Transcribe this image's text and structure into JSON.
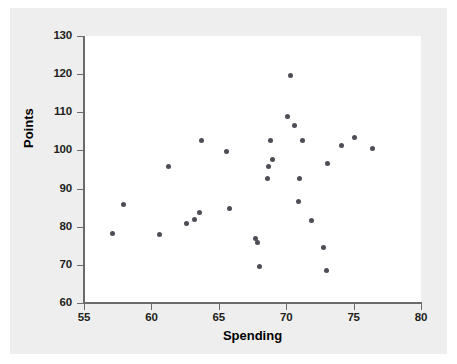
{
  "chart_data": {
    "type": "scatter",
    "title": "",
    "xlabel": "Spending",
    "ylabel": "Points",
    "xlim": [
      55,
      80
    ],
    "ylim": [
      60,
      130
    ],
    "xticks": [
      55,
      60,
      65,
      70,
      75,
      80
    ],
    "yticks": [
      60,
      70,
      80,
      90,
      100,
      110,
      120,
      130
    ],
    "grid": false,
    "legend": null,
    "marker_color": "#4d4d56",
    "plot_background": "#ffffff",
    "figure_background": "#eeeeee",
    "points": [
      {
        "x": 57.1,
        "y": 78.2
      },
      {
        "x": 57.9,
        "y": 85.9
      },
      {
        "x": 60.6,
        "y": 78.0
      },
      {
        "x": 61.3,
        "y": 95.9
      },
      {
        "x": 62.6,
        "y": 80.9
      },
      {
        "x": 63.2,
        "y": 81.8
      },
      {
        "x": 63.6,
        "y": 83.8
      },
      {
        "x": 63.7,
        "y": 102.6
      },
      {
        "x": 65.6,
        "y": 99.8
      },
      {
        "x": 65.8,
        "y": 84.7
      },
      {
        "x": 67.7,
        "y": 77.0
      },
      {
        "x": 67.9,
        "y": 75.8
      },
      {
        "x": 68.0,
        "y": 69.7
      },
      {
        "x": 68.6,
        "y": 92.6
      },
      {
        "x": 68.7,
        "y": 95.7
      },
      {
        "x": 68.8,
        "y": 102.5
      },
      {
        "x": 69.0,
        "y": 97.6
      },
      {
        "x": 70.1,
        "y": 108.8
      },
      {
        "x": 70.3,
        "y": 119.7
      },
      {
        "x": 70.6,
        "y": 106.5
      },
      {
        "x": 70.9,
        "y": 86.6
      },
      {
        "x": 71.0,
        "y": 92.6
      },
      {
        "x": 71.2,
        "y": 102.5
      },
      {
        "x": 71.9,
        "y": 81.5
      },
      {
        "x": 72.8,
        "y": 74.5
      },
      {
        "x": 73.0,
        "y": 68.5
      },
      {
        "x": 73.1,
        "y": 96.6
      },
      {
        "x": 74.1,
        "y": 101.4
      },
      {
        "x": 75.1,
        "y": 103.3
      },
      {
        "x": 76.4,
        "y": 100.4
      }
    ]
  },
  "axes": {
    "x_title": "Spending",
    "y_title": "Points",
    "x_tick_labels": [
      "55",
      "60",
      "65",
      "70",
      "75",
      "80"
    ],
    "y_tick_labels": [
      "60",
      "70",
      "80",
      "90",
      "100",
      "110",
      "120",
      "130"
    ]
  }
}
